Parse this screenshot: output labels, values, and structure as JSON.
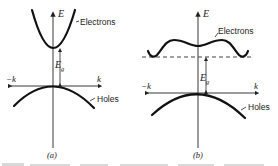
{
  "figure": {
    "panels": [
      {
        "id": "a",
        "label": "(a)",
        "axis_e_label": "E",
        "axis_k_pos_label": "k",
        "axis_k_neg_label": "−k",
        "gap_label_main": "E",
        "gap_label_sub": "g",
        "conduction_band_label": "Electrons",
        "valence_band_label": "Holes",
        "description": "Direct band gap: conduction band minimum aligned with valence band maximum at k = 0"
      },
      {
        "id": "b",
        "label": "(b)",
        "axis_e_label": "E",
        "axis_k_pos_label": "k",
        "axis_k_neg_label": "−k",
        "gap_label_main": "E",
        "gap_label_sub": "g",
        "conduction_band_label": "Electrons",
        "valence_band_label": "Holes",
        "description": "Indirect band gap: conduction band minima at k ≠ 0 (dashed level), valence band maximum at k = 0"
      }
    ]
  }
}
